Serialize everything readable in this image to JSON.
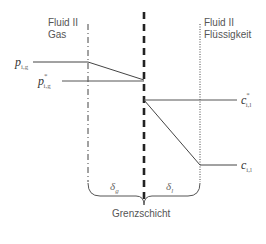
{
  "labels": {
    "gas_title_line1": "Fluid II",
    "gas_title_line2": "Gas",
    "liquid_title_line1": "Fluid II",
    "liquid_title_line2": "Flüssigkeit",
    "boundary_layer": "Grenzschicht"
  },
  "symbols": {
    "p_bulk": {
      "base": "p",
      "sub": "i,g",
      "sup": ""
    },
    "p_interface": {
      "base": "p",
      "sub": "i,g",
      "sup": "*"
    },
    "c_interface": {
      "base": "c",
      "sub": "i,l",
      "sup": "*"
    },
    "c_bulk": {
      "base": "c",
      "sub": "i,l",
      "sup": ""
    },
    "delta_gas": {
      "base": "δ",
      "sub": "g"
    },
    "delta_liquid": {
      "base": "δ",
      "sub": "l"
    }
  },
  "colors": {
    "line": "#333333",
    "interface_line": "#222222",
    "text": "#555555"
  }
}
